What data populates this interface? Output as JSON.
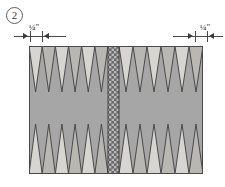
{
  "step": {
    "number": "2",
    "badge_name": "step-number-badge"
  },
  "dimensions": {
    "left": {
      "label": "¼\"",
      "value": "1/4",
      "unit": "inch",
      "position": "left-edge-seam-allowance"
    },
    "right": {
      "label": "¼\"",
      "value": "1/4",
      "unit": "inch",
      "position": "right-edge-seam-allowance"
    }
  },
  "board": {
    "description": "Pieced quilt panel of sawtooth points with a center striped bar",
    "outline_color": "#4a4a4a",
    "background_color": "#a6a6a6",
    "light_point_color": "#d7d5cf",
    "mid_point_color": "#b9b7b1",
    "center_bar": {
      "base_color": "#6e6e6e",
      "accent_color": "#b5b5b5",
      "label": "center-striped-bar"
    },
    "top_row": {
      "label": "top-points-row",
      "direction": "down",
      "count_left": 6,
      "count_right": 6,
      "fills": [
        "light",
        "mid",
        "light",
        "mid",
        "light",
        "mid"
      ]
    },
    "bottom_row": {
      "label": "bottom-points-row",
      "direction": "up",
      "count_left": 6,
      "count_right": 6,
      "fills": [
        "light",
        "mid",
        "light",
        "mid",
        "light",
        "mid"
      ]
    },
    "middle_band": {
      "label": "plain-center-band",
      "color": "#a6a6a6"
    }
  }
}
